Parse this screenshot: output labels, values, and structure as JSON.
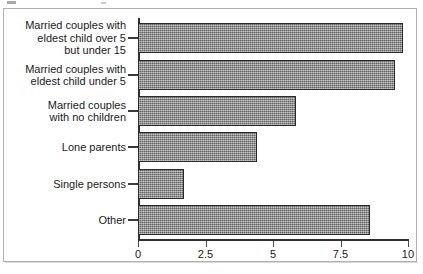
{
  "chart_data": {
    "type": "bar",
    "orientation": "horizontal",
    "title": "",
    "xlabel": "",
    "ylabel": "",
    "xlim": [
      0,
      10
    ],
    "grid": false,
    "legend": null,
    "xticks": [
      "0",
      "2.5",
      "5",
      "7.5",
      "10"
    ],
    "xtick_values": [
      0,
      2.5,
      5,
      7.5,
      10
    ],
    "categories": [
      "Married couples with\neldest child over 5\nbut under 15",
      "Married couples with\neldest child under 5",
      "Married couples\nwith no children",
      "Lone parents",
      "Single persons",
      "Other"
    ],
    "values": [
      9.8,
      9.5,
      5.85,
      4.4,
      1.7,
      8.6
    ],
    "bar_fill": "#8b8b8b",
    "bar_border": "#2a2a2a",
    "axis_color": "#303030",
    "background": "#ffffff"
  }
}
